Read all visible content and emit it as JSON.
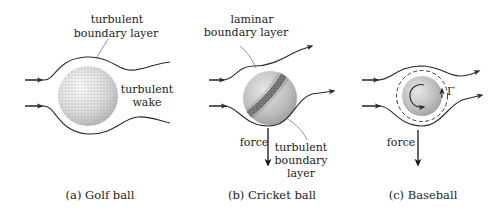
{
  "figure": {
    "panels": [
      {
        "id": "a",
        "caption": "(a) Golf ball",
        "labels": {
          "boundary_line1": "turbulent",
          "boundary_line2": "boundary layer",
          "wake_line1": "turbulent",
          "wake_line2": "wake"
        }
      },
      {
        "id": "b",
        "caption": "(b) Cricket ball",
        "labels": {
          "laminar_line1": "laminar",
          "laminar_line2": "boundary layer",
          "force": "force",
          "turb_line1": "turbulent",
          "turb_line2": "boundary",
          "turb_line3": "layer"
        }
      },
      {
        "id": "c",
        "caption": "(c) Baseball",
        "labels": {
          "circulation": "Γ",
          "force": "force"
        }
      }
    ],
    "colors": {
      "line": "#2a2a2a",
      "ball_light": "#f2f2f2",
      "ball_dark": "#a8a8a8",
      "leader": "#666666"
    }
  }
}
